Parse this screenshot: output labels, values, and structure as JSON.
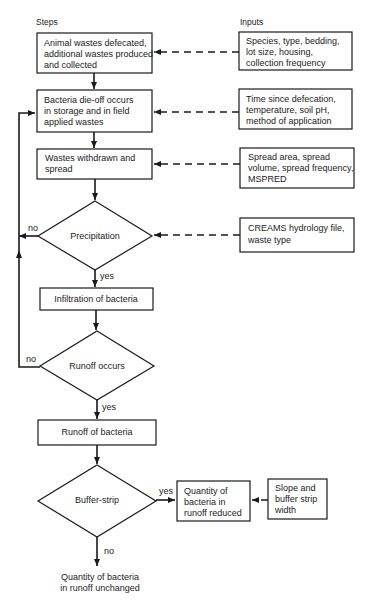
{
  "headers": {
    "steps": "Steps",
    "inputs": "Inputs"
  },
  "steps": [
    {
      "id": "animal-wastes",
      "lines": [
        "Animal wastes defecated,",
        "additional wastes produced",
        "and collected"
      ]
    },
    {
      "id": "bacteria-die-off",
      "lines": [
        "Bacteria die-off occurs",
        "in storage and in field",
        "applied wastes"
      ]
    },
    {
      "id": "wastes-withdrawn",
      "lines": [
        "Wastes withdrawn and",
        "spread"
      ]
    },
    {
      "id": "precipitation",
      "type": "decision",
      "lines": [
        "Precipitation"
      ]
    },
    {
      "id": "infiltration",
      "lines": [
        "Infiltration of bacteria"
      ]
    },
    {
      "id": "runoff-occurs",
      "type": "decision",
      "lines": [
        "Runoff occurs"
      ]
    },
    {
      "id": "runoff-of-bacteria",
      "lines": [
        "Runoff of bacteria"
      ]
    },
    {
      "id": "buffer-strip",
      "type": "decision",
      "lines": [
        "Buffer-strip"
      ]
    },
    {
      "id": "quantity-reduced",
      "lines": [
        "Quantity of",
        "bacteria in",
        "runoff reduced"
      ]
    },
    {
      "id": "quantity-unchanged",
      "type": "terminal",
      "lines": [
        "Quantity of bacteria",
        "in runoff unchanged"
      ]
    }
  ],
  "inputs": [
    {
      "id": "input-animal",
      "lines": [
        "Species, type, bedding,",
        "lot size, housing,",
        "collection frequency"
      ]
    },
    {
      "id": "input-dieoff",
      "lines": [
        "Time since defecation,",
        "temperature, soil pH,",
        "method of application"
      ]
    },
    {
      "id": "input-spread",
      "lines": [
        "Spread area, spread",
        "volume, spread frequency,",
        "MSPRED"
      ]
    },
    {
      "id": "input-precip",
      "lines": [
        "CREAMS hydrology file,",
        "waste type"
      ]
    },
    {
      "id": "input-buffer",
      "lines": [
        "Slope and",
        "buffer strip",
        "width"
      ]
    }
  ],
  "labels": {
    "precip_no": "no",
    "precip_yes": "yes",
    "runoff_no": "no",
    "runoff_yes": "yes",
    "buffer_yes": "yes",
    "buffer_no": "no"
  }
}
